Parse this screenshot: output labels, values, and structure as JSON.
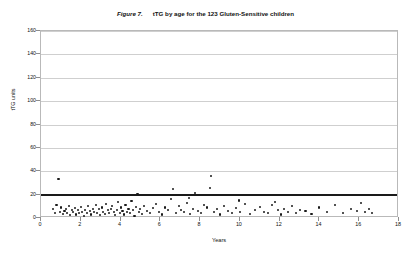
{
  "figure": {
    "label": "Figure 7.",
    "caption": "tTG  by age for the 123 Gluten-Sensitive children"
  },
  "chart_data": {
    "type": "scatter",
    "xlabel": "Years",
    "ylabel": "tTG units",
    "xlim": [
      0,
      18
    ],
    "ylim": [
      0,
      160
    ],
    "xticks": [
      0,
      2,
      4,
      6,
      8,
      10,
      12,
      14,
      16,
      18
    ],
    "yticks": [
      0,
      20,
      40,
      60,
      80,
      100,
      120,
      140,
      160
    ],
    "grid": "horizontal",
    "legend": "none",
    "n_points": 123,
    "threshold_line": {
      "value": 20,
      "orientation": "horizontal",
      "color": "#1a1a1a"
    },
    "series": [
      {
        "name": "Gluten-Sensitive children",
        "marker": "dot",
        "color": "#1a1a1a",
        "points": [
          [
            0.62,
            7.5
          ],
          [
            0.7,
            4.0
          ],
          [
            0.78,
            11.0
          ],
          [
            0.88,
            33.0
          ],
          [
            0.95,
            5.0
          ],
          [
            1.02,
            9.0
          ],
          [
            1.1,
            3.5
          ],
          [
            1.18,
            6.0
          ],
          [
            1.25,
            8.0
          ],
          [
            1.32,
            4.5
          ],
          [
            1.4,
            10.0
          ],
          [
            1.48,
            2.5
          ],
          [
            1.55,
            6.5
          ],
          [
            1.62,
            5.0
          ],
          [
            1.7,
            8.5
          ],
          [
            1.78,
            3.0
          ],
          [
            1.85,
            7.0
          ],
          [
            1.92,
            4.0
          ],
          [
            2.0,
            9.5
          ],
          [
            2.08,
            5.5
          ],
          [
            2.15,
            2.0
          ],
          [
            2.22,
            7.0
          ],
          [
            2.3,
            4.5
          ],
          [
            2.38,
            10.5
          ],
          [
            2.45,
            6.0
          ],
          [
            2.52,
            3.0
          ],
          [
            2.6,
            8.0
          ],
          [
            2.68,
            5.0
          ],
          [
            2.75,
            11.5
          ],
          [
            2.82,
            4.0
          ],
          [
            2.9,
            7.5
          ],
          [
            2.98,
            2.5
          ],
          [
            3.05,
            9.0
          ],
          [
            3.12,
            5.5
          ],
          [
            3.2,
            3.5
          ],
          [
            3.28,
            12.0
          ],
          [
            3.35,
            6.5
          ],
          [
            3.42,
            4.0
          ],
          [
            3.5,
            8.0
          ],
          [
            3.58,
            10.0
          ],
          [
            3.65,
            5.0
          ],
          [
            3.72,
            2.5
          ],
          [
            3.8,
            7.0
          ],
          [
            3.88,
            13.5
          ],
          [
            3.95,
            4.5
          ],
          [
            4.02,
            9.0
          ],
          [
            4.1,
            6.0
          ],
          [
            4.18,
            3.0
          ],
          [
            4.25,
            11.0
          ],
          [
            4.32,
            5.5
          ],
          [
            4.4,
            8.0
          ],
          [
            4.48,
            4.0
          ],
          [
            4.55,
            14.5
          ],
          [
            4.62,
            6.5
          ],
          [
            4.7,
            2.0
          ],
          [
            4.78,
            9.5
          ],
          [
            4.85,
            20.5
          ],
          [
            4.92,
            5.0
          ],
          [
            5.0,
            7.5
          ],
          [
            5.1,
            3.5
          ],
          [
            5.2,
            10.0
          ],
          [
            5.35,
            6.0
          ],
          [
            5.5,
            4.5
          ],
          [
            5.65,
            8.5
          ],
          [
            5.8,
            12.0
          ],
          [
            5.95,
            5.0
          ],
          [
            6.1,
            3.0
          ],
          [
            6.25,
            9.0
          ],
          [
            6.4,
            6.5
          ],
          [
            6.55,
            16.0
          ],
          [
            6.65,
            25.0
          ],
          [
            6.8,
            4.0
          ],
          [
            6.95,
            10.5
          ],
          [
            7.05,
            7.0
          ],
          [
            7.2,
            5.0
          ],
          [
            7.35,
            13.0
          ],
          [
            7.5,
            3.5
          ],
          [
            7.65,
            8.0
          ],
          [
            7.75,
            21.5
          ],
          [
            7.9,
            6.0
          ],
          [
            8.05,
            4.5
          ],
          [
            8.2,
            11.0
          ],
          [
            8.35,
            9.0
          ],
          [
            8.5,
            26.0
          ],
          [
            8.55,
            36.0
          ],
          [
            8.7,
            5.5
          ],
          [
            8.85,
            7.5
          ],
          [
            9.0,
            3.0
          ],
          [
            9.2,
            10.0
          ],
          [
            9.4,
            6.0
          ],
          [
            9.6,
            4.0
          ],
          [
            9.8,
            8.5
          ],
          [
            10.0,
            5.0
          ],
          [
            10.25,
            12.0
          ],
          [
            10.5,
            3.5
          ],
          [
            10.75,
            7.0
          ],
          [
            11.0,
            9.5
          ],
          [
            11.2,
            5.5
          ],
          [
            11.4,
            4.0
          ],
          [
            11.6,
            11.5
          ],
          [
            11.75,
            14.0
          ],
          [
            11.9,
            6.5
          ],
          [
            12.05,
            3.0
          ],
          [
            12.2,
            8.0
          ],
          [
            12.4,
            5.0
          ],
          [
            12.6,
            10.0
          ],
          [
            12.8,
            4.5
          ],
          [
            13.0,
            7.0
          ],
          [
            13.3,
            6.0
          ],
          [
            13.6,
            3.5
          ],
          [
            14.0,
            9.0
          ],
          [
            14.4,
            5.0
          ],
          [
            14.8,
            11.0
          ],
          [
            15.2,
            4.0
          ],
          [
            15.6,
            7.5
          ],
          [
            15.9,
            6.0
          ],
          [
            16.1,
            12.5
          ],
          [
            16.3,
            5.5
          ],
          [
            16.5,
            8.0
          ],
          [
            16.65,
            4.5
          ],
          [
            5.05,
            19.5
          ],
          [
            7.45,
            17.0
          ],
          [
            9.95,
            15.0
          ]
        ]
      }
    ]
  }
}
